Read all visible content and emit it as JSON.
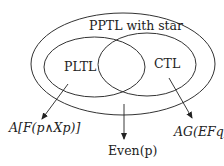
{
  "diagram": {
    "outer_set": {
      "label": "PPTL with star"
    },
    "left_set": {
      "label": "PLTL"
    },
    "right_set": {
      "label": "CTL"
    },
    "examples": [
      {
        "id": "pltl-example",
        "text": "A[F(p∧Xp)]"
      },
      {
        "id": "intersection-example",
        "text": "Even(p)"
      },
      {
        "id": "ctl-example",
        "text": "AG(EFq)"
      }
    ],
    "colors": {
      "stroke": "#333333",
      "text": "#222222",
      "background": "#ffffff"
    }
  }
}
